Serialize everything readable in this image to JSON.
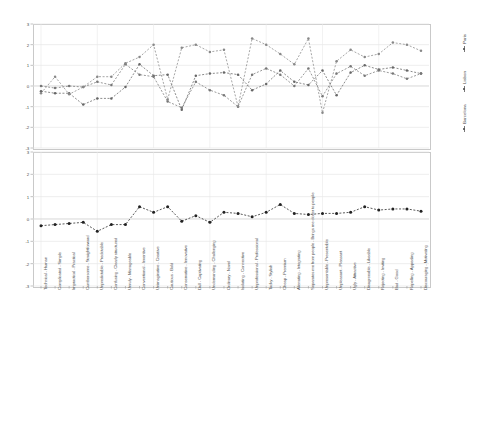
{
  "chart_data": {
    "type": "line",
    "title": "",
    "xlabel": "",
    "ylabel": "",
    "ylim": [
      -3,
      3
    ],
    "yticks": [
      3,
      2,
      1,
      0,
      -1,
      -2,
      -3
    ],
    "grid": true,
    "legend_position": "right",
    "categories": [
      "Technical - Human",
      "Complicated - Simple",
      "Impractical - Practical",
      "Cumbersome - Straightforward",
      "Unpredictable - Predictable",
      "Confusing - Clearly structured",
      "Unruly - Manageable",
      "Conventional - Inventive",
      "Unimaginative - Creative",
      "Cautious - Bold",
      "Conservative - Innovative",
      "Dull - Captivating",
      "Undemanding - Challenging",
      "Ordinary - Novel",
      "Isolating - Connective",
      "Unprofessional - Professional",
      "Tacky - Stylish",
      "Cheap - Premium",
      "Alienating - Integrating",
      "Separates me from people - Brings me closer to people",
      "Unpresentable - Presentable",
      "Unpleasant - Pleasant",
      "Ugly - Attractive",
      "Disagreeable - Likeable",
      "Rejecting - Inviting",
      "Bad - Good",
      "Repelling - Appealing",
      "Discouraging - Motivating"
    ],
    "panels": [
      {
        "name": "per-city-profile",
        "series": [
          {
            "name": "Barcelona",
            "color": "#666666",
            "values": [
              -0.25,
              -0.35,
              -0.35,
              -0.9,
              -0.6,
              -0.6,
              -0.05,
              1.05,
              0.5,
              0.55,
              -1.15,
              0.5,
              0.6,
              0.65,
              0.55,
              -0.2,
              0.1,
              0.75,
              0.2,
              0.05,
              0.75,
              -0.45,
              0.65,
              1.0,
              0.8,
              0.9,
              0.75,
              0.6
            ]
          },
          {
            "name": "Lisbon",
            "color": "#777777",
            "values": [
              0.0,
              -0.1,
              0.0,
              -0.05,
              0.2,
              0.05,
              1.05,
              0.55,
              0.45,
              -0.75,
              -1.05,
              0.2,
              -0.2,
              -0.45,
              -1.0,
              0.55,
              0.85,
              0.55,
              0.0,
              0.85,
              -0.5,
              0.6,
              0.95,
              0.5,
              0.75,
              0.6,
              0.35,
              0.6
            ]
          },
          {
            "name": "Paris",
            "color": "#888888",
            "values": [
              -0.35,
              0.45,
              -0.4,
              -0.05,
              0.45,
              0.45,
              1.1,
              1.4,
              2.0,
              -0.65,
              1.85,
              2.0,
              1.65,
              1.75,
              -1.0,
              2.3,
              2.0,
              1.55,
              1.05,
              2.3,
              -1.3,
              1.2,
              1.75,
              1.4,
              1.55,
              2.1,
              2.0,
              1.7
            ]
          }
        ]
      },
      {
        "name": "overall-mean",
        "series": [
          {
            "name": "Mean",
            "color": "#222222",
            "values": [
              -0.3,
              -0.25,
              -0.2,
              -0.15,
              -0.55,
              -0.25,
              -0.25,
              0.55,
              0.3,
              0.55,
              -0.1,
              0.15,
              -0.15,
              0.3,
              0.25,
              0.1,
              0.3,
              0.65,
              0.25,
              0.2,
              0.25,
              0.25,
              0.3,
              0.55,
              0.4,
              0.45,
              0.45,
              0.35
            ]
          }
        ]
      }
    ]
  }
}
